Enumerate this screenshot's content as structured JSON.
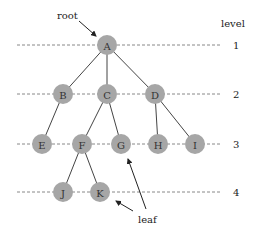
{
  "diagram": {
    "type": "tree",
    "labels": {
      "root": "root",
      "leaf": "leaf",
      "level_header": "level"
    },
    "levels": [
      {
        "label": "1",
        "y": 45
      },
      {
        "label": "2",
        "y": 94
      },
      {
        "label": "3",
        "y": 144
      },
      {
        "label": "4",
        "y": 192
      }
    ],
    "nodes": [
      {
        "id": "A",
        "x": 107,
        "y": 45,
        "level": 1
      },
      {
        "id": "B",
        "x": 63,
        "y": 94,
        "level": 2
      },
      {
        "id": "C",
        "x": 107,
        "y": 94,
        "level": 2
      },
      {
        "id": "D",
        "x": 155,
        "y": 94,
        "level": 2
      },
      {
        "id": "E",
        "x": 42,
        "y": 144,
        "level": 3
      },
      {
        "id": "F",
        "x": 82,
        "y": 144,
        "level": 3
      },
      {
        "id": "G",
        "x": 121,
        "y": 144,
        "level": 3
      },
      {
        "id": "H",
        "x": 158,
        "y": 144,
        "level": 3
      },
      {
        "id": "I",
        "x": 195,
        "y": 144,
        "level": 3
      },
      {
        "id": "J",
        "x": 63,
        "y": 192,
        "level": 4
      },
      {
        "id": "K",
        "x": 100,
        "y": 192,
        "level": 4
      }
    ],
    "edges": [
      [
        "A",
        "B"
      ],
      [
        "A",
        "C"
      ],
      [
        "A",
        "D"
      ],
      [
        "B",
        "E"
      ],
      [
        "C",
        "F"
      ],
      [
        "C",
        "G"
      ],
      [
        "D",
        "H"
      ],
      [
        "D",
        "I"
      ],
      [
        "F",
        "J"
      ],
      [
        "F",
        "K"
      ]
    ],
    "colors": {
      "node_fill": "#a6a6a6",
      "edge": "#444444",
      "dashed_line": "#888888"
    }
  }
}
